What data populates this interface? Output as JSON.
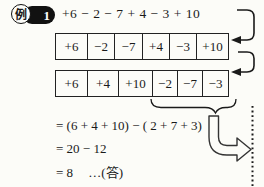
{
  "badge": {
    "label": "例",
    "number": "1"
  },
  "expression": "+6 − 2 − 7 + 4 − 3 + 10",
  "row1": {
    "cells": [
      "+6",
      "−2",
      "−7",
      "+4",
      "−3",
      "+10"
    ]
  },
  "row2": {
    "cells": [
      "+6",
      "+4",
      "+10",
      "−2",
      "−7",
      "−3"
    ]
  },
  "solution": {
    "line1": "= (6 + 4 + 10) − ( 2 + 7 + 3)",
    "line2": "= 20 − 12",
    "line3": "= 8",
    "answer_note": "…(答)"
  },
  "icons": {
    "hook_arrow_top": "arrow pointing left into first row",
    "hook_arrow_bottom": "arrow pointing left into second row",
    "underbrace": "brace grouping the negative terms",
    "big_hollow_arrow": "outlined arrow pointing right toward page edge"
  },
  "colors": {
    "ink": "#1a1a1a",
    "background": "#fcfcf8"
  }
}
